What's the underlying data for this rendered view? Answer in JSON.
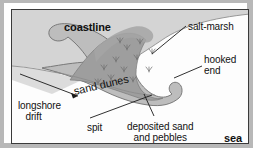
{
  "diagram": {
    "labels": {
      "coastline": "coastline",
      "salt_marsh": "salt-marsh",
      "hooked_end_line1": "hooked",
      "hooked_end_line2": "end",
      "longshore_line1": "longshore",
      "longshore_line2": "drift",
      "sand_dunes": "sand dunes",
      "spit": "spit",
      "deposited_line1": "deposited sand",
      "deposited_line2": "and pebbles",
      "sea": "sea"
    },
    "colors": {
      "land": "#d4d4d4",
      "salt_marsh": "#9e9e9e",
      "spit_sand": "#bdbdbd",
      "sea": "#fdfdfd",
      "ink": "#1a1a1a",
      "frame": "#3a3a3a",
      "page_border": "#b8b8b8"
    },
    "features": [
      "coastline landmass",
      "salt-marsh vegetation",
      "sand dunes ridge",
      "recurved hooked end",
      "longshore drift arrow",
      "deposited sand and pebbles",
      "open sea"
    ]
  }
}
